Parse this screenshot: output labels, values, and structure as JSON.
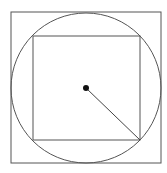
{
  "diagram": {
    "stroke_color": "#555555",
    "dot_color": "#111111",
    "outer_square": {
      "x": 11,
      "y": 12,
      "width": 150,
      "height": 151
    },
    "circle": {
      "cx": 86,
      "cy": 88,
      "r": 75
    },
    "inner_square": {
      "x": 33,
      "y": 36,
      "width": 107,
      "height": 104
    },
    "center_point": {
      "cx": 86,
      "cy": 88,
      "r": 3
    },
    "radius_line": {
      "x1": 86,
      "y1": 88,
      "x2": 140,
      "y2": 140
    }
  }
}
